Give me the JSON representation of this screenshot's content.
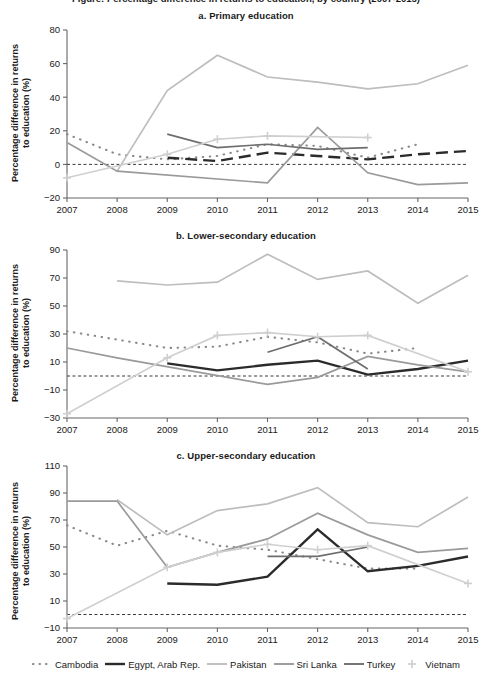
{
  "figure": {
    "cropped_top_caption": "Figure: Percentage difference in returns to education, by country (2007-2015)",
    "ylabel_line1": "Percentage difference in returns",
    "ylabel_line2": "to education (%)"
  },
  "legend": {
    "position": "bottom",
    "items": [
      {
        "name": "Cambodia",
        "style": "dotted",
        "color": "#8a8a8a"
      },
      {
        "name": "Egypt, Arab Rep.",
        "style": "solid",
        "color": "#2b2b2b"
      },
      {
        "name": "Pakistan",
        "style": "solid",
        "color": "#bdbdbd"
      },
      {
        "name": "Sri Lanka",
        "style": "solid",
        "color": "#9a9a9a"
      },
      {
        "name": "Turkey",
        "style": "solid",
        "color": "#6e6e6e"
      },
      {
        "name": "Vietnam",
        "style": "plus",
        "color": "#cfcfcf"
      }
    ]
  },
  "chart_data": [
    {
      "type": "line",
      "title": "a. Primary education",
      "xlabel": "",
      "ylabel": "Percentage difference in returns to education (%)",
      "x": [
        2007,
        2008,
        2009,
        2010,
        2011,
        2012,
        2013,
        2014,
        2015
      ],
      "xticks": [
        "2007",
        "2008",
        "2009",
        "2010",
        "2011",
        "2012",
        "2013",
        "2014",
        "2015"
      ],
      "yticks": [
        -20,
        0,
        20,
        40,
        60,
        80
      ],
      "ylim": [
        -20,
        80
      ],
      "xlim": [
        2007,
        2015
      ],
      "zero_reference_line": 0,
      "grid": false,
      "series": [
        {
          "name": "Cambodia",
          "style": "dotted",
          "color": "#8a8a8a",
          "x": [
            2007,
            2008,
            2009,
            2010,
            2011,
            2012,
            2013,
            2014,
            2015
          ],
          "values": [
            18,
            6,
            3,
            5,
            12,
            11,
            4,
            12,
            null
          ]
        },
        {
          "name": "Egypt, Arab Rep.",
          "style": "dashed",
          "color": "#2b2b2b",
          "x": [
            2009,
            2010,
            2011,
            2012,
            2013,
            2014,
            2015
          ],
          "values": [
            4,
            2,
            7,
            5,
            3,
            6,
            8
          ]
        },
        {
          "name": "Pakistan",
          "style": "solid",
          "color": "#bdbdbd",
          "x": [
            2008,
            2009,
            2010,
            2011,
            2012,
            2013,
            2014,
            2015
          ],
          "values": [
            -4,
            44,
            65,
            52,
            49,
            45,
            48,
            59
          ]
        },
        {
          "name": "Sri Lanka",
          "style": "solid",
          "color": "#9a9a9a",
          "x": [
            2007,
            2008,
            2011,
            2012,
            2013,
            2014,
            2015
          ],
          "values": [
            13,
            -4,
            -11,
            22,
            -5,
            -12,
            -11
          ]
        },
        {
          "name": "Turkey",
          "style": "solid",
          "color": "#6e6e6e",
          "x": [
            2009,
            2010,
            2011,
            2012,
            2013
          ],
          "values": [
            18,
            10,
            12,
            9,
            10
          ]
        },
        {
          "name": "Vietnam",
          "style": "plus",
          "color": "#cfcfcf",
          "x": [
            2007,
            2009,
            2010,
            2011,
            2013
          ],
          "values": [
            -8,
            6,
            15,
            17,
            16
          ]
        }
      ]
    },
    {
      "type": "line",
      "title": "b. Lower-secondary education",
      "xlabel": "",
      "ylabel": "Percentage difference in returns to education (%)",
      "x": [
        2007,
        2008,
        2009,
        2010,
        2011,
        2012,
        2013,
        2014,
        2015
      ],
      "xticks": [
        "2007",
        "2008",
        "2009",
        "2010",
        "2011",
        "2012",
        "2013",
        "2014",
        "2015"
      ],
      "yticks": [
        -30,
        -10,
        10,
        30,
        50,
        70,
        90
      ],
      "ylim": [
        -30,
        90
      ],
      "xlim": [
        2007,
        2015
      ],
      "zero_reference_line": 0,
      "grid": false,
      "series": [
        {
          "name": "Cambodia",
          "style": "dotted",
          "color": "#8a8a8a",
          "x": [
            2007,
            2008,
            2009,
            2010,
            2011,
            2012,
            2013,
            2014,
            2015
          ],
          "values": [
            32,
            26,
            20,
            21,
            28,
            24,
            16,
            20,
            null
          ]
        },
        {
          "name": "Egypt, Arab Rep.",
          "style": "solid",
          "color": "#2b2b2b",
          "x": [
            2009,
            2010,
            2011,
            2012,
            2013,
            2014,
            2015
          ],
          "values": [
            9,
            4,
            8,
            11,
            1,
            5,
            11
          ]
        },
        {
          "name": "Pakistan",
          "style": "solid",
          "color": "#bdbdbd",
          "x": [
            2008,
            2009,
            2010,
            2011,
            2012,
            2013,
            2014,
            2015
          ],
          "values": [
            68,
            65,
            67,
            87,
            69,
            75,
            52,
            72
          ]
        },
        {
          "name": "Sri Lanka",
          "style": "solid",
          "color": "#9a9a9a",
          "x": [
            2007,
            2008,
            2011,
            2012,
            2013,
            2014,
            2015
          ],
          "values": [
            20,
            13,
            -6,
            -1,
            14,
            8,
            3
          ]
        },
        {
          "name": "Turkey",
          "style": "solid",
          "color": "#6e6e6e",
          "x": [
            2011,
            2012,
            2013
          ],
          "values": [
            17,
            28,
            5
          ]
        },
        {
          "name": "Vietnam",
          "style": "plus",
          "color": "#cfcfcf",
          "x": [
            2007,
            2009,
            2010,
            2011,
            2012,
            2013,
            2015
          ],
          "values": [
            -27,
            13,
            29,
            31,
            28,
            29,
            3
          ]
        }
      ]
    },
    {
      "type": "line",
      "title": "c. Upper-secondary education",
      "xlabel": "",
      "ylabel": "Percentage difference in returns to education (%)",
      "x": [
        2007,
        2008,
        2009,
        2010,
        2011,
        2012,
        2013,
        2014,
        2015
      ],
      "xticks": [
        "2007",
        "2008",
        "2009",
        "2010",
        "2011",
        "2012",
        "2013",
        "2014",
        "2015"
      ],
      "yticks": [
        -10,
        10,
        30,
        50,
        70,
        90,
        110
      ],
      "ylim": [
        -10,
        110
      ],
      "xlim": [
        2007,
        2015
      ],
      "zero_reference_line": 0,
      "grid": false,
      "series": [
        {
          "name": "Cambodia",
          "style": "dotted",
          "color": "#8a8a8a",
          "x": [
            2007,
            2008,
            2009,
            2010,
            2011,
            2012,
            2013,
            2014,
            2015
          ],
          "values": [
            66,
            51,
            62,
            51,
            48,
            41,
            34,
            34,
            null
          ]
        },
        {
          "name": "Egypt, Arab Rep.",
          "style": "solid",
          "color": "#2b2b2b",
          "x": [
            2009,
            2010,
            2011,
            2012,
            2013,
            2014,
            2015
          ],
          "values": [
            23,
            22,
            28,
            63,
            32,
            36,
            43
          ]
        },
        {
          "name": "Pakistan",
          "style": "solid",
          "color": "#bdbdbd",
          "x": [
            2008,
            2009,
            2010,
            2011,
            2012,
            2013,
            2014,
            2015
          ],
          "values": [
            85,
            59,
            77,
            82,
            94,
            68,
            65,
            87
          ]
        },
        {
          "name": "Sri Lanka",
          "style": "solid",
          "color": "#9a9a9a",
          "x": [
            2007,
            2008,
            2009,
            2010,
            2011,
            2012,
            2013,
            2014,
            2015
          ],
          "values": [
            84,
            84,
            35,
            46,
            56,
            75,
            59,
            46,
            49
          ]
        },
        {
          "name": "Turkey",
          "style": "solid",
          "color": "#6e6e6e",
          "x": [
            2011,
            2012,
            2013
          ],
          "values": [
            43,
            43,
            50
          ]
        },
        {
          "name": "Vietnam",
          "style": "plus",
          "color": "#cfcfcf",
          "x": [
            2007,
            2009,
            2010,
            2011,
            2012,
            2013,
            2015
          ],
          "values": [
            -3,
            35,
            46,
            52,
            48,
            51,
            23
          ]
        }
      ]
    }
  ]
}
